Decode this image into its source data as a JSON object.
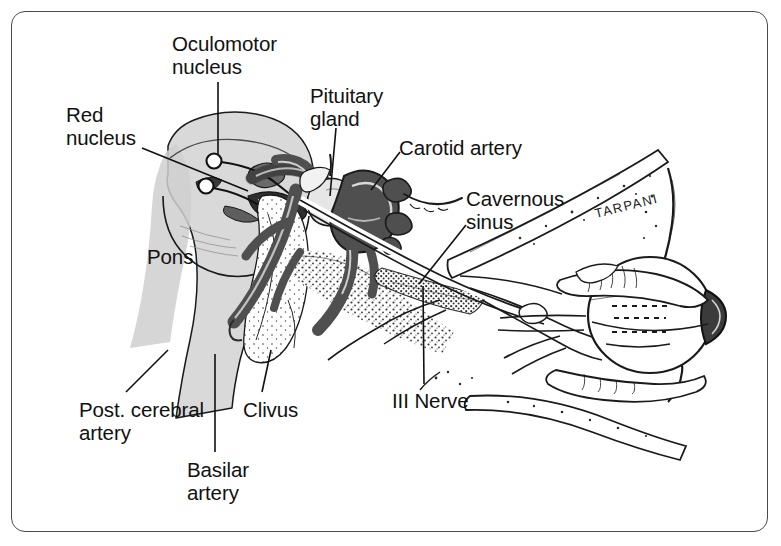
{
  "figure": {
    "type": "anatomical line illustration",
    "frame": {
      "border_color": "#4a4a4a",
      "background": "#ffffff",
      "corner_radius_px": 14
    },
    "artist_signature": "TARPANI"
  },
  "palette": {
    "ink": "#111111",
    "line": "#1a1a1a",
    "brainstem_fill": "#d9d9d9",
    "brainstem_shadow": "#c2c2c2",
    "artery_fill": "#4f4f4f",
    "artery_dark": "#2b2b2b",
    "bone_stipple": "#2a2a2a",
    "paper": "#ffffff"
  },
  "labels": [
    {
      "id": "red-nucleus",
      "text": "Red\nnucleus",
      "x": 66,
      "y": 103,
      "align": "left"
    },
    {
      "id": "oculomotor-nucleus",
      "text": "Oculomotor\nnucleus",
      "x": 172,
      "y": 32,
      "align": "left"
    },
    {
      "id": "pituitary-gland",
      "text": "Pituitary\ngland",
      "x": 310,
      "y": 84,
      "align": "left"
    },
    {
      "id": "carotid-artery",
      "text": "Carotid artery",
      "x": 399,
      "y": 136,
      "align": "left"
    },
    {
      "id": "cavernous-sinus",
      "text": "Cavernous\nsinus",
      "x": 466,
      "y": 187,
      "align": "left"
    },
    {
      "id": "pons",
      "text": "Pons",
      "x": 147,
      "y": 245,
      "align": "left"
    },
    {
      "id": "post-cerebral-artery",
      "text": "Post. cerebral\nartery",
      "x": 79,
      "y": 398,
      "align": "left"
    },
    {
      "id": "clivus",
      "text": "Clivus",
      "x": 243,
      "y": 398,
      "align": "left"
    },
    {
      "id": "basilar-artery",
      "text": "Basilar\nartery",
      "x": 187,
      "y": 458,
      "align": "left"
    },
    {
      "id": "iii-nerve",
      "text": "III Nerve",
      "x": 392,
      "y": 389,
      "align": "left"
    }
  ],
  "leader_lines": [
    {
      "id": "leader-red-nucleus",
      "from": [
        142,
        148
      ],
      "to": [
        245,
        190
      ]
    },
    {
      "id": "leader-oculomotor-nucleus",
      "from": [
        218,
        80
      ],
      "to": [
        218,
        160
      ]
    },
    {
      "id": "leader-pituitary-gland",
      "from": [
        334,
        128
      ],
      "to": [
        330,
        196
      ]
    },
    {
      "id": "leader-carotid-artery",
      "from": [
        400,
        152
      ],
      "to": [
        372,
        188
      ]
    },
    {
      "id": "leader-cavernous-sinus",
      "from": [
        466,
        222
      ],
      "to": [
        420,
        282
      ]
    },
    {
      "id": "leader-post-cerebral",
      "from": [
        126,
        392
      ],
      "to": [
        167,
        352
      ]
    },
    {
      "id": "leader-clivus",
      "from": [
        262,
        392
      ],
      "to": [
        270,
        352
      ]
    },
    {
      "id": "leader-basilar-artery",
      "from": [
        215,
        452
      ],
      "to": [
        215,
        355
      ]
    },
    {
      "id": "leader-iii-nerve",
      "from": [
        424,
        384
      ],
      "to": [
        423,
        288
      ]
    }
  ],
  "structures": [
    {
      "id": "brainstem-midbrain-pons",
      "name": "Brainstem (midbrain and pons)"
    },
    {
      "id": "red-nucleus-marker",
      "name": "Red nucleus marker circle"
    },
    {
      "id": "oculomotor-nucleus-marker",
      "name": "Oculomotor nucleus marker circle"
    },
    {
      "id": "basilar-artery-vessel",
      "name": "Basilar artery"
    },
    {
      "id": "posterior-cerebral-artery-vessel",
      "name": "Posterior cerebral artery"
    },
    {
      "id": "carotid-artery-siphon",
      "name": "Internal carotid artery siphon"
    },
    {
      "id": "pituitary-gland-body",
      "name": "Pituitary gland"
    },
    {
      "id": "clivus-bone",
      "name": "Clivus bone"
    },
    {
      "id": "cavernous-sinus-region",
      "name": "Cavernous sinus"
    },
    {
      "id": "third-nerve-trunk",
      "name": "Oculomotor (III) nerve"
    },
    {
      "id": "orbit-and-globe",
      "name": "Orbit with eyeball, lens and extraocular muscles"
    },
    {
      "id": "orbital-roof-bone",
      "name": "Orbital roof bone"
    }
  ]
}
